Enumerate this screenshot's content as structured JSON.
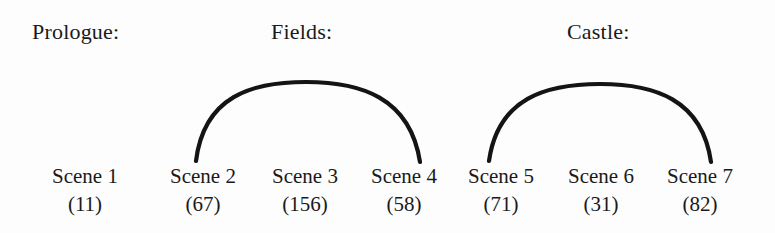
{
  "figure": {
    "type": "diagram",
    "background_color": "#fdfdfd",
    "ink_color": "#141414"
  },
  "groups": [
    {
      "id": "prologue",
      "label": "Prologue:",
      "x": 32
    },
    {
      "id": "fields",
      "label": "Fields:",
      "x": 271
    },
    {
      "id": "castle",
      "label": "Castle:",
      "x": 567
    }
  ],
  "scenes": [
    {
      "name": "Scene 1",
      "count": "(11)",
      "center_x": 85
    },
    {
      "name": "Scene 2",
      "count": "(67)",
      "center_x": 203
    },
    {
      "name": "Scene 3",
      "count": "(156)",
      "center_x": 305
    },
    {
      "name": "Scene 4",
      "count": "(58)",
      "center_x": 404
    },
    {
      "name": "Scene 5",
      "count": "(71)",
      "center_x": 501
    },
    {
      "name": "Scene 6",
      "count": "(31)",
      "center_x": 601
    },
    {
      "name": "Scene 7",
      "count": "(82)",
      "center_x": 700
    }
  ],
  "arcs": [
    {
      "id": "arc-fields",
      "from": "Scene 2",
      "to": "Scene 4",
      "path": "M 196 161 C 204 96 252 82 306 82 C 360 82 410 97 420 162"
    },
    {
      "id": "arc-castle",
      "from": "Scene 5",
      "to": "Scene 7",
      "path": "M 489 161 C 498 98 546 84 600 84 C 654 84 702 99 711 162"
    }
  ]
}
